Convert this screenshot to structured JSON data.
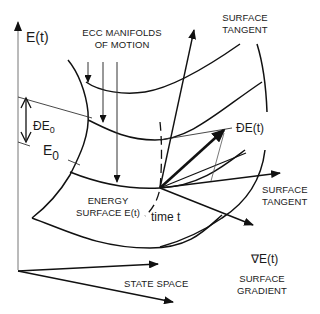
{
  "diagram": {
    "axis_labels": {
      "energy_axis": "E(t)",
      "state_space": "STATE SPACE"
    },
    "labels": {
      "manifolds_line1": "ECC MANIFOLDS",
      "manifolds_line2": "OF MOTION",
      "surface_tangent_top_line1": "SURFACE",
      "surface_tangent_top_line2": "TANGENT",
      "surface_tangent_right_line1": "SURFACE",
      "surface_tangent_right_line2": "TANGENT",
      "delta_e0": "ĐE",
      "delta_e0_sub": "0",
      "e0": "E",
      "e0_sub": "0",
      "delta_e_t": "ĐE(t)",
      "energy_surface_line1": "ENERGY",
      "energy_surface_line2": "SURFACE E(t)",
      "time_t": "time t",
      "gradient_symbol": "∇E(t)",
      "gradient_line1": "SURFACE",
      "gradient_line2": "GRADIENT"
    },
    "colors": {
      "stroke": "#111111",
      "thin_stroke": "#444444",
      "background": "#ffffff"
    }
  }
}
